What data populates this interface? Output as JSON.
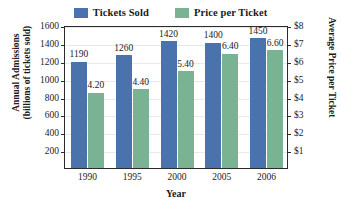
{
  "chart_data": {
    "type": "bar",
    "title": "",
    "categories": [
      "1990",
      "1995",
      "2000",
      "2005",
      "2006"
    ],
    "series": [
      {
        "name": "Tickets Sold",
        "color": "#4a72ad",
        "axis": "left",
        "values": [
          1190,
          1260,
          1420,
          1400,
          1450
        ],
        "labels": [
          "1190",
          "1260",
          "1420",
          "1400",
          "1450"
        ]
      },
      {
        "name": "Price per Ticket",
        "color": "#7ab394",
        "axis": "right",
        "values": [
          4.2,
          4.4,
          5.4,
          6.4,
          6.6
        ],
        "labels": [
          "4.20",
          "4.40",
          "5.40",
          "6.40",
          "6.60"
        ]
      }
    ],
    "xlabel": "Year",
    "ylabel": "Annual Admissions (billions of tickets sold)",
    "ylabel_line1": "Annual Admissions",
    "ylabel_line2": "(billions of tickets sold)",
    "y2label": "Average Price per Ticket",
    "ylim": [
      0,
      1600
    ],
    "y2lim": [
      0,
      8
    ],
    "yticks": [
      200,
      400,
      600,
      800,
      1000,
      1200,
      1400,
      1600
    ],
    "ytick_labels": [
      "200",
      "400",
      "600",
      "800",
      "1000",
      "1200",
      "1400",
      "1600"
    ],
    "y2ticks": [
      1,
      2,
      3,
      4,
      5,
      6,
      7,
      8
    ],
    "y2tick_labels": [
      "$1",
      "$2",
      "$3",
      "$4",
      "$5",
      "$6",
      "$7",
      "$8"
    ],
    "grid": true,
    "legend_position": "top-center"
  },
  "legend": {
    "entries": [
      {
        "label": "Tickets Sold",
        "color": "#4a72ad"
      },
      {
        "label": "Price per Ticket",
        "color": "#7ab394"
      }
    ]
  },
  "colors": {
    "tickets_sold": "#4a72ad",
    "price_per_ticket": "#7ab394",
    "axis": "#2b2b2b",
    "grid": "#e9e9e9",
    "text": "#1b1b1b",
    "background": "#ffffff"
  }
}
